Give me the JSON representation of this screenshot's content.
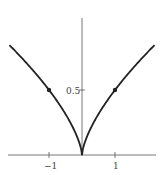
{
  "chart_data": {
    "type": "line",
    "title": "",
    "xlabel": "",
    "ylabel": "",
    "function": "y = 0.5 * |x|^(2/3)",
    "x": [
      -2.2,
      -1.5,
      -1,
      -0.5,
      -0.1,
      0,
      0.1,
      0.5,
      1,
      1.5,
      2.2
    ],
    "y": [
      0.85,
      0.66,
      0.5,
      0.31,
      0.11,
      0,
      0.11,
      0.31,
      0.5,
      0.66,
      0.85
    ],
    "marked_points": [
      {
        "x": -1,
        "y": 0.5
      },
      {
        "x": 1,
        "y": 0.5
      }
    ],
    "xticks": [
      "-1",
      "1"
    ],
    "yticks": [
      "0.5"
    ],
    "xlim": [
      -2.4,
      2.4
    ],
    "ylim": [
      0,
      1.1
    ],
    "grid": false,
    "legend": null
  },
  "labels": {
    "xneg1": "−1",
    "xpos1": "1",
    "y05": "0.5"
  }
}
